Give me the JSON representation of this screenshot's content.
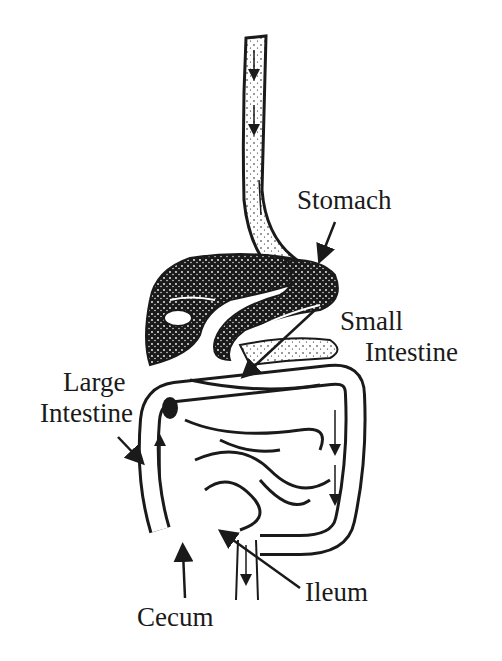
{
  "diagram": {
    "colors": {
      "ink": "#1a1a1a",
      "background": "#ffffff"
    },
    "labels": {
      "stomach": "Stomach",
      "small_intestine_line1": "Small",
      "small_intestine_line2": "Intestine",
      "large_intestine_line1": "Large",
      "large_intestine_line2": "Intestine",
      "cecum": "Cecum",
      "ileum": "Ileum"
    }
  }
}
